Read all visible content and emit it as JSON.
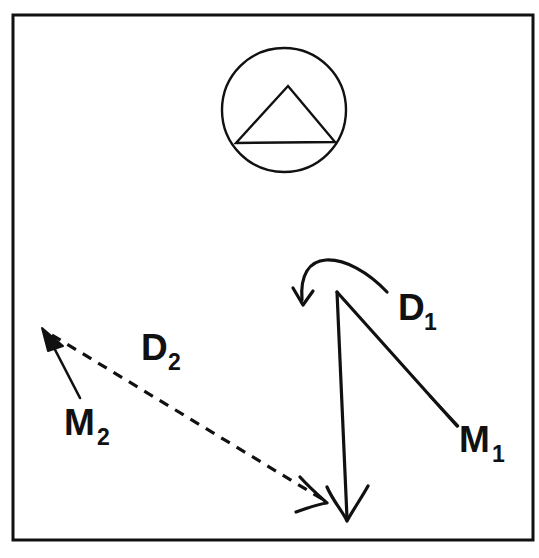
{
  "figure": {
    "kind": "line-diagram",
    "background_color": "#ffffff",
    "ink_color": "#111111",
    "frame": {
      "name": "outer-border",
      "x": 13,
      "y": 15,
      "width": 520,
      "height": 525,
      "stroke_width": 3
    }
  },
  "symbol": {
    "name": "circle-with-triangle",
    "circle": {
      "cx": 284,
      "cy": 110,
      "r": 62,
      "stroke_width": 2
    },
    "triangle": {
      "apex_x": 288,
      "apex_y": 86,
      "left_x": 236,
      "left_y": 143,
      "right_x": 335,
      "right_y": 142,
      "stroke_width": 2
    }
  },
  "labels": {
    "d1": {
      "text": "D",
      "sub": "1",
      "x": 400,
      "y": 318
    },
    "d2": {
      "text": "D",
      "sub": "2",
      "x": 143,
      "y": 360
    },
    "m1": {
      "text": "M",
      "sub": "1",
      "x": 461,
      "y": 450
    },
    "m2": {
      "text": "M",
      "sub": "2",
      "x": 66,
      "y": 434
    }
  },
  "strokes": {
    "vertical_arrow": {
      "name": "d1-vertical-arrow",
      "from_x": 337,
      "from_y": 292,
      "to_x": 347,
      "to_y": 521,
      "head": "open-v",
      "stroke_width": 3
    },
    "diagonal_line": {
      "name": "d1-m1-diagonal",
      "from_x": 337,
      "from_y": 292,
      "to_x": 456,
      "to_y": 425,
      "stroke_width": 3
    },
    "curved_arrow": {
      "name": "d1-curved-arrow",
      "from_x": 386,
      "from_y": 291,
      "to_x": 303,
      "to_y": 303,
      "head": "open-v",
      "stroke_width": 3
    },
    "dashed_arrow": {
      "name": "d2-dashed-arrow",
      "from_x": 50,
      "from_y": 334,
      "to_x": 326,
      "to_y": 501,
      "head": "open-v",
      "dash": "10 8",
      "stroke_width": 3
    },
    "solid_head_line": {
      "name": "m2-leader-line",
      "from_x": 80,
      "from_y": 398,
      "to_x": 45,
      "to_y": 332,
      "head": "filled-triangle",
      "stroke_width": 3
    },
    "m1_leader": {
      "name": "m1-leader-line",
      "from_x": 428,
      "from_y": 394,
      "to_x": 458,
      "to_y": 426,
      "stroke_width": 3
    }
  }
}
